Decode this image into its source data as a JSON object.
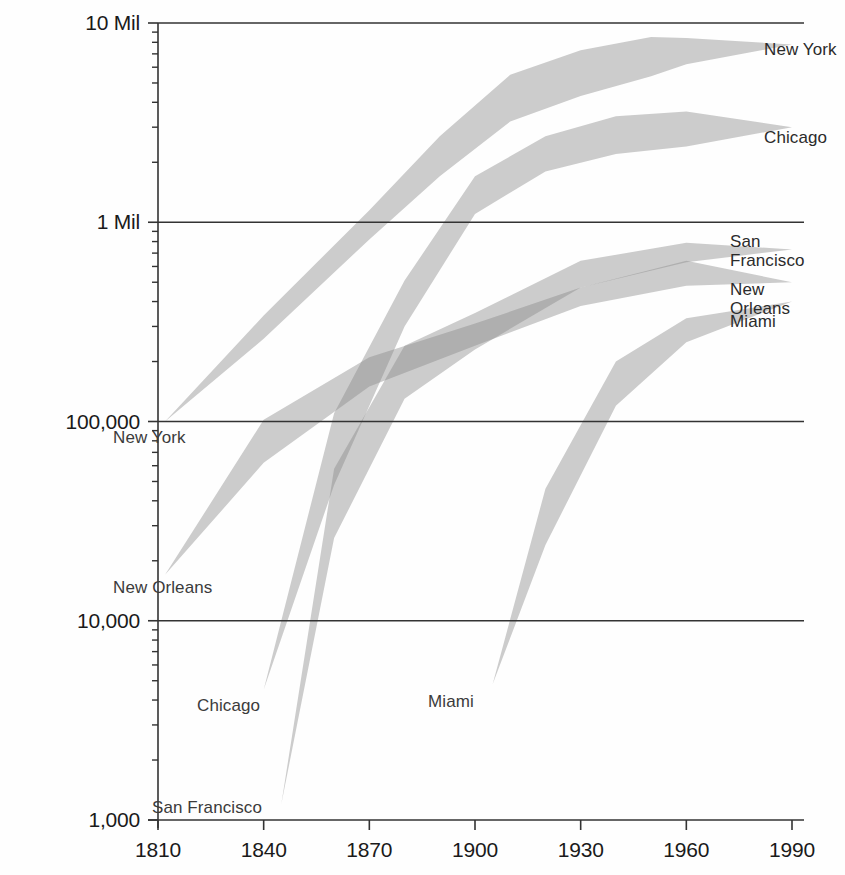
{
  "chart_data": {
    "type": "area",
    "title": "",
    "subtitle": "",
    "xlabel": "",
    "ylabel": "",
    "yscale": "log",
    "xlim": [
      1800,
      2000
    ],
    "ylim": [
      1000,
      10000000
    ],
    "grid": "horizontal-major-only",
    "legend_position": "inline-at-series-ends",
    "x_tick_labels": [
      "1810",
      "1840",
      "1870",
      "1900",
      "1930",
      "1960",
      "1990"
    ],
    "x_tick_values": [
      1810,
      1840,
      1870,
      1900,
      1930,
      1960,
      1990
    ],
    "y_tick_labels": [
      "1,000",
      "10,000",
      "100,000",
      "1 Mil",
      "10 Mil"
    ],
    "y_tick_values": [
      1000,
      10000,
      100000,
      1000000,
      10000000
    ],
    "y_minor_ticks_per_decade": [
      2,
      3,
      4,
      5,
      6,
      7,
      8,
      9
    ],
    "band_fill": "#888888",
    "band_opacity": 0.42,
    "axis_color": "#333333",
    "series": [
      {
        "name": "New York",
        "label_start": "New York",
        "label_end": "New York",
        "upper": [
          {
            "x": 1812,
            "y": 100000
          },
          {
            "x": 1840,
            "y": 340000
          },
          {
            "x": 1870,
            "y": 1150000
          },
          {
            "x": 1890,
            "y": 2700000
          },
          {
            "x": 1910,
            "y": 5500000
          },
          {
            "x": 1930,
            "y": 7300000
          },
          {
            "x": 1950,
            "y": 8500000
          },
          {
            "x": 1960,
            "y": 8400000
          },
          {
            "x": 1990,
            "y": 7800000
          }
        ],
        "lower": [
          {
            "x": 1812,
            "y": 100000
          },
          {
            "x": 1840,
            "y": 260000
          },
          {
            "x": 1870,
            "y": 820000
          },
          {
            "x": 1890,
            "y": 1700000
          },
          {
            "x": 1910,
            "y": 3200000
          },
          {
            "x": 1930,
            "y": 4300000
          },
          {
            "x": 1950,
            "y": 5400000
          },
          {
            "x": 1960,
            "y": 6200000
          },
          {
            "x": 1990,
            "y": 7800000
          }
        ]
      },
      {
        "name": "Chicago",
        "label_start": "Chicago",
        "label_end": "Chicago",
        "upper": [
          {
            "x": 1840,
            "y": 4500
          },
          {
            "x": 1860,
            "y": 110000
          },
          {
            "x": 1880,
            "y": 510000
          },
          {
            "x": 1900,
            "y": 1700000
          },
          {
            "x": 1920,
            "y": 2700000
          },
          {
            "x": 1940,
            "y": 3400000
          },
          {
            "x": 1960,
            "y": 3600000
          },
          {
            "x": 1990,
            "y": 3000000
          }
        ],
        "lower": [
          {
            "x": 1840,
            "y": 4500
          },
          {
            "x": 1860,
            "y": 48000
          },
          {
            "x": 1880,
            "y": 300000
          },
          {
            "x": 1900,
            "y": 1100000
          },
          {
            "x": 1920,
            "y": 1800000
          },
          {
            "x": 1940,
            "y": 2200000
          },
          {
            "x": 1960,
            "y": 2400000
          },
          {
            "x": 1990,
            "y": 3000000
          }
        ]
      },
      {
        "name": "New Orleans",
        "label_start": "New Orleans",
        "label_end": "New Orleans",
        "upper": [
          {
            "x": 1812,
            "y": 17000
          },
          {
            "x": 1840,
            "y": 102000
          },
          {
            "x": 1870,
            "y": 210000
          },
          {
            "x": 1900,
            "y": 310000
          },
          {
            "x": 1930,
            "y": 470000
          },
          {
            "x": 1960,
            "y": 640000
          },
          {
            "x": 1990,
            "y": 500000
          }
        ],
        "lower": [
          {
            "x": 1812,
            "y": 17000
          },
          {
            "x": 1840,
            "y": 62000
          },
          {
            "x": 1870,
            "y": 150000
          },
          {
            "x": 1900,
            "y": 240000
          },
          {
            "x": 1930,
            "y": 380000
          },
          {
            "x": 1960,
            "y": 480000
          },
          {
            "x": 1990,
            "y": 500000
          }
        ]
      },
      {
        "name": "San Francisco",
        "label_start": "San Francisco",
        "label_end": "San Francisco",
        "upper": [
          {
            "x": 1845,
            "y": 1200
          },
          {
            "x": 1860,
            "y": 58000
          },
          {
            "x": 1880,
            "y": 240000
          },
          {
            "x": 1900,
            "y": 350000
          },
          {
            "x": 1930,
            "y": 640000
          },
          {
            "x": 1960,
            "y": 790000
          },
          {
            "x": 1990,
            "y": 730000
          }
        ],
        "lower": [
          {
            "x": 1845,
            "y": 1200
          },
          {
            "x": 1860,
            "y": 26000
          },
          {
            "x": 1880,
            "y": 130000
          },
          {
            "x": 1900,
            "y": 230000
          },
          {
            "x": 1930,
            "y": 470000
          },
          {
            "x": 1960,
            "y": 630000
          },
          {
            "x": 1990,
            "y": 730000
          }
        ]
      },
      {
        "name": "Miami",
        "label_start": "Miami",
        "label_end": "Miami",
        "upper": [
          {
            "x": 1905,
            "y": 4800
          },
          {
            "x": 1920,
            "y": 46000
          },
          {
            "x": 1940,
            "y": 200000
          },
          {
            "x": 1960,
            "y": 330000
          },
          {
            "x": 1990,
            "y": 400000
          }
        ],
        "lower": [
          {
            "x": 1905,
            "y": 4800
          },
          {
            "x": 1920,
            "y": 24000
          },
          {
            "x": 1940,
            "y": 120000
          },
          {
            "x": 1960,
            "y": 250000
          },
          {
            "x": 1990,
            "y": 400000
          }
        ]
      }
    ]
  },
  "labels": {
    "start": [
      {
        "name": "New York",
        "text": "New York",
        "x": 113,
        "y": 428
      },
      {
        "name": "New Orleans",
        "text": "New Orleans",
        "x": 113,
        "y": 578
      },
      {
        "name": "Chicago",
        "text": "Chicago",
        "x": 197,
        "y": 696
      },
      {
        "name": "San Francisco",
        "text": "San Francisco",
        "x": 152,
        "y": 798
      },
      {
        "name": "Miami",
        "text": "Miami",
        "x": 428,
        "y": 692
      }
    ],
    "end": [
      {
        "name": "New York",
        "lines": [
          "New York"
        ],
        "x": 764,
        "y": 40
      },
      {
        "name": "Chicago",
        "lines": [
          "Chicago"
        ],
        "x": 764,
        "y": 128
      },
      {
        "name": "San Francisco",
        "lines": [
          "San",
          "Francisco"
        ],
        "x": 730,
        "y": 232
      },
      {
        "name": "New Orleans",
        "lines": [
          "New",
          "Orleans"
        ],
        "x": 730,
        "y": 280
      },
      {
        "name": "Miami",
        "lines": [
          "Miami"
        ],
        "x": 730,
        "y": 312
      }
    ]
  },
  "axes": {
    "x_ticks": [
      {
        "label": "1810",
        "value": 1810
      },
      {
        "label": "1840",
        "value": 1840
      },
      {
        "label": "1870",
        "value": 1870
      },
      {
        "label": "1900",
        "value": 1900
      },
      {
        "label": "1930",
        "value": 1930
      },
      {
        "label": "1960",
        "value": 1960
      },
      {
        "label": "1990",
        "value": 1990
      }
    ],
    "y_ticks": [
      {
        "label": "10 Mil",
        "value": 10000000
      },
      {
        "label": "1 Mil",
        "value": 1000000
      },
      {
        "label": "100,000",
        "value": 100000
      },
      {
        "label": "10,000",
        "value": 10000
      },
      {
        "label": "1,000",
        "value": 1000
      }
    ]
  }
}
